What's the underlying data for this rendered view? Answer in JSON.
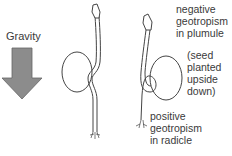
{
  "labels": {
    "gravity": "Gravity",
    "plumule_l1": "negative",
    "plumule_l2": "geotropism",
    "plumule_l3": "in plumule",
    "seed_l1": "(seed",
    "seed_l2": "planted",
    "seed_l3": "upside",
    "seed_l4": "down)",
    "radicle_l1": "positive",
    "radicle_l2": "geotropism",
    "radicle_l3": "in radicle"
  },
  "colors": {
    "arrow_fill": "#8c8c8c",
    "outline": "#444444"
  }
}
